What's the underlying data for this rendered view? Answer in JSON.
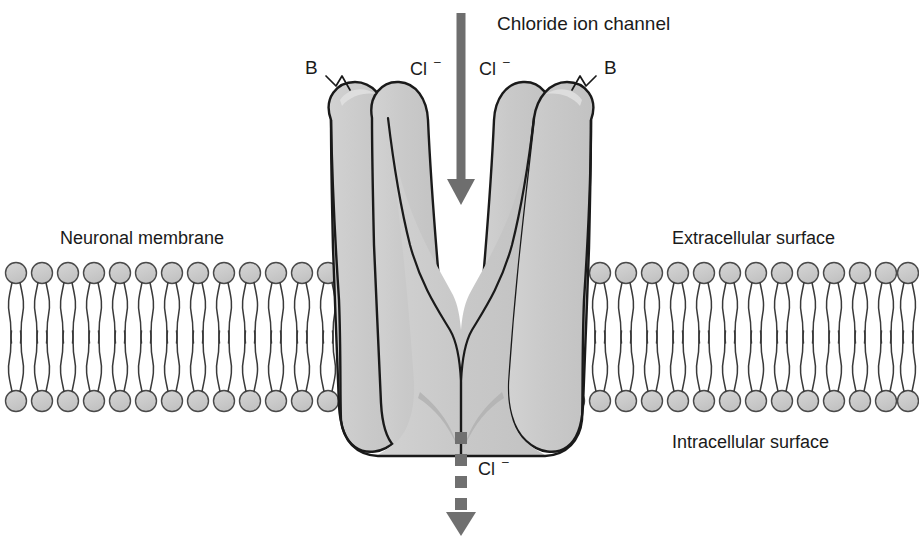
{
  "figure": {
    "title": "Chloride ion channel",
    "background_color": "#ffffff",
    "width": 919,
    "height": 536
  },
  "labels": {
    "channel_title": "Chloride ion channel",
    "neuronal_membrane": "Neuronal membrane",
    "extracellular_surface": "Extracellular surface",
    "intracellular_surface": "Intracellular surface",
    "chloride_symbol": "Cl",
    "chloride_charge": "–",
    "binding_site_left": "B",
    "binding_site_right": "B"
  },
  "ions": {
    "extracellular_left": {
      "symbol": "Cl",
      "charge": "–"
    },
    "extracellular_right": {
      "symbol": "Cl",
      "charge": "–"
    },
    "intracellular": {
      "symbol": "Cl",
      "charge": "–"
    }
  },
  "arrows": {
    "influx": {
      "style": "solid",
      "direction": "down",
      "color": "#6e6e6e",
      "meaning": "chloride ion entering channel"
    },
    "efflux": {
      "style": "dashed",
      "direction": "down",
      "color": "#707070",
      "meaning": "chloride ion exiting into cell"
    }
  },
  "colors": {
    "protein_fill": "#c9c9c9",
    "protein_shadow": "#b0b0b0",
    "protein_highlight": "#d8d8d8",
    "outline": "#1a1a1a",
    "lipid_head_fill": "#c9c9c9",
    "lipid_tail": "#3a3a3a",
    "arrow_gray": "#6e6e6e",
    "text": "#1a1a1a"
  },
  "membrane": {
    "top_y": 262,
    "bottom_y": 412,
    "left_segment_heads": 14,
    "right_segment_heads": 14,
    "head_radius": 11,
    "head_spacing": 26,
    "description": "phospholipid bilayer with circular head groups and paired wavy tails"
  },
  "channel": {
    "subunits": 4,
    "shape": "funnel narrowing to a central pore constriction at the intracellular face",
    "pore_center_x": 461,
    "top_y": 80,
    "bottom_y": 455
  }
}
